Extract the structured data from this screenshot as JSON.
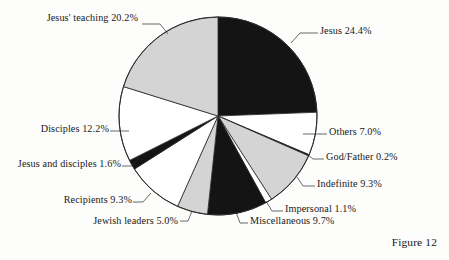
{
  "figure": {
    "caption": "Figure 12",
    "background_color": "#fdfdfc"
  },
  "chart_data": {
    "type": "pie",
    "title": "",
    "xlabel": "",
    "ylabel": "",
    "legend_position": "none",
    "grid": false,
    "start_angle_deg": 0,
    "direction": "clockwise",
    "center": {
      "x": 218,
      "y": 116
    },
    "radius": 99,
    "total_percent": 100.0,
    "categories": [
      "Jesus",
      "Others",
      "God/Father",
      "Indefinite",
      "Impersonal",
      "Miscellaneous",
      "Jewish leaders",
      "Recipients",
      "Jesus and disciples",
      "Disciples",
      "Jesus' teaching"
    ],
    "values": [
      24.4,
      7.0,
      0.2,
      9.3,
      1.1,
      9.7,
      5.0,
      9.3,
      1.6,
      12.2,
      20.2
    ],
    "colors": [
      "#141414",
      "#ffffff",
      "#141414",
      "#d4d4d4",
      "#ffffff",
      "#141414",
      "#d4d4d4",
      "#ffffff",
      "#141414",
      "#ffffff",
      "#d4d4d4"
    ],
    "slices": [
      {
        "label": "Jesus",
        "value": 24.4,
        "display": "Jesus 24.4%",
        "fill": "#141414"
      },
      {
        "label": "Others",
        "value": 7.0,
        "display": "Others 7.0%",
        "fill": "#ffffff"
      },
      {
        "label": "God/Father",
        "value": 0.2,
        "display": "God/Father 0.2%",
        "fill": "#141414"
      },
      {
        "label": "Indefinite",
        "value": 9.3,
        "display": "Indefinite 9.3%",
        "fill": "#d4d4d4"
      },
      {
        "label": "Impersonal",
        "value": 1.1,
        "display": "Impersonal 1.1%",
        "fill": "#ffffff"
      },
      {
        "label": "Miscellaneous",
        "value": 9.7,
        "display": "Miscellaneous 9.7%",
        "fill": "#141414"
      },
      {
        "label": "Jewish leaders",
        "value": 5.0,
        "display": "Jewish leaders 5.0%",
        "fill": "#d4d4d4"
      },
      {
        "label": "Recipients",
        "value": 9.3,
        "display": "Recipients 9.3%",
        "fill": "#ffffff"
      },
      {
        "label": "Jesus and disciples",
        "value": 1.6,
        "display": "Jesus and disciples 1.6%",
        "fill": "#141414"
      },
      {
        "label": "Disciples",
        "value": 12.2,
        "display": "Disciples 12.2%",
        "fill": "#ffffff"
      },
      {
        "label": "Jesus' teaching",
        "value": 20.2,
        "display": "Jesus' teaching 20.2%",
        "fill": "#d4d4d4"
      }
    ]
  },
  "labels": {
    "jesus_teaching": "Jesus' teaching 20.2%",
    "jesus": "Jesus 24.4%",
    "others": "Others 7.0%",
    "god_father": "God/Father 0.2%",
    "indefinite": "Indefinite 9.3%",
    "impersonal": "Impersonal 1.1%",
    "miscellaneous": "Miscellaneous 9.7%",
    "jewish_leaders": "Jewish leaders 5.0%",
    "recipients": "Recipients 9.3%",
    "jesus_and_disciples": "Jesus and disciples 1.6%",
    "disciples": "Disciples 12.2%"
  }
}
